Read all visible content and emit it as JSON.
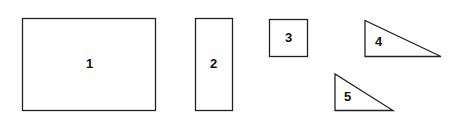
{
  "diagram": {
    "shapes": [
      {
        "id": "1",
        "type": "rectangle",
        "label": "1"
      },
      {
        "id": "2",
        "type": "rectangle",
        "label": "2"
      },
      {
        "id": "3",
        "type": "square",
        "label": "3"
      },
      {
        "id": "4",
        "type": "right-triangle",
        "label": "4"
      },
      {
        "id": "5",
        "type": "right-triangle",
        "label": "5"
      }
    ]
  }
}
